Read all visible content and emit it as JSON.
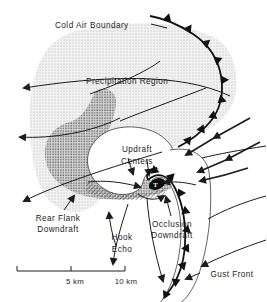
{
  "figure": {
    "colors": {
      "paper": "#ffffff",
      "ink": "#1c1c1c",
      "precipitation_shade": "#c4c4c4",
      "hook_shade": "#7d7d7d"
    }
  },
  "labels": {
    "cold_air_boundary": "Cold Air Boundary",
    "precipitation_region": "Precipitation Region",
    "updraft_line1": "Updraft",
    "updraft_line2": "Centers",
    "rear_flank_line1": "Rear Flank",
    "rear_flank_line2": "Downdraft",
    "hook_line1": "Hook",
    "hook_line2": "Echo",
    "occlusion_line1": "Occlusion",
    "occlusion_line2": "Downdraft",
    "gust_front": "Gust Front",
    "tornado_marker": "T"
  },
  "scale_bar": {
    "label_5km": "5 km",
    "label_10km": "10 km"
  }
}
